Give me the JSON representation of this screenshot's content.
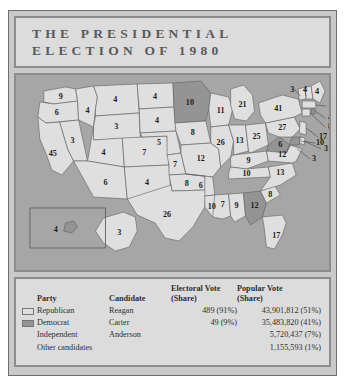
{
  "title": {
    "line1": "THE PRESIDENTIAL",
    "line2": "ELECTION OF 1980"
  },
  "colors": {
    "page_background": "#ffffff",
    "figure_background": "#c9c9c9",
    "frame_border": "#6e6e6e",
    "panel_border": "#8c8c8c",
    "title_background": "#dcdcdc",
    "title_text": "#5a5a5a",
    "ocean": "#a6a6a6",
    "republican_fill": "#dfdfdf",
    "democrat_fill": "#949494",
    "state_outline": "#5f5f5f",
    "table_background": "#dcdcdc",
    "table_text": "#2f2f2f"
  },
  "legend_table": {
    "headers": {
      "party": "Party",
      "candidate": "Candidate",
      "electoral_line1": "Electoral Vote",
      "electoral_line2": "(Share)",
      "popular_line1": "Popular Vote",
      "popular_line2": "(Share)"
    },
    "rows": [
      {
        "swatch": "republican-swatch",
        "party": "Republican",
        "candidate": "Reagan",
        "electoral": "489 (91%)",
        "popular": "43,901,812 (51%)"
      },
      {
        "swatch": "democrat-swatch",
        "party": "Democrat",
        "candidate": "Carter",
        "electoral": "49 (9%)",
        "popular": "35,483,820 (41%)"
      },
      {
        "swatch": "none",
        "party": "Independent",
        "candidate": "Anderson",
        "electoral": "",
        "popular": "5,720,437 (7%)"
      },
      {
        "swatch": "none",
        "party": "Other candidates",
        "candidate": "",
        "electoral": "",
        "popular": "1,155,593 (1%)"
      }
    ]
  },
  "map": {
    "type": "choropleth-electoral-map",
    "region": "United States",
    "year": 1980,
    "states": [
      {
        "code": "WA",
        "electoral_votes": 9,
        "winner": "Republican"
      },
      {
        "code": "OR",
        "electoral_votes": 6,
        "winner": "Republican"
      },
      {
        "code": "CA",
        "electoral_votes": 45,
        "winner": "Republican"
      },
      {
        "code": "NV",
        "electoral_votes": 3,
        "winner": "Republican"
      },
      {
        "code": "ID",
        "electoral_votes": 4,
        "winner": "Republican"
      },
      {
        "code": "MT",
        "electoral_votes": 4,
        "winner": "Republican"
      },
      {
        "code": "WY",
        "electoral_votes": 3,
        "winner": "Republican"
      },
      {
        "code": "UT",
        "electoral_votes": 4,
        "winner": "Republican"
      },
      {
        "code": "CO",
        "electoral_votes": 7,
        "winner": "Republican"
      },
      {
        "code": "AZ",
        "electoral_votes": 6,
        "winner": "Republican"
      },
      {
        "code": "NM",
        "electoral_votes": 4,
        "winner": "Republican"
      },
      {
        "code": "ND",
        "electoral_votes": 4,
        "winner": "Republican"
      },
      {
        "code": "SD",
        "electoral_votes": 4,
        "winner": "Republican"
      },
      {
        "code": "NE",
        "electoral_votes": 5,
        "winner": "Republican"
      },
      {
        "code": "KS",
        "electoral_votes": 7,
        "winner": "Republican"
      },
      {
        "code": "OK",
        "electoral_votes": 8,
        "winner": "Republican"
      },
      {
        "code": "TX",
        "electoral_votes": 26,
        "winner": "Republican"
      },
      {
        "code": "MN",
        "electoral_votes": 10,
        "winner": "Democrat"
      },
      {
        "code": "IA",
        "electoral_votes": 8,
        "winner": "Republican"
      },
      {
        "code": "MO",
        "electoral_votes": 12,
        "winner": "Republican"
      },
      {
        "code": "AR",
        "electoral_votes": 6,
        "winner": "Republican"
      },
      {
        "code": "LA",
        "electoral_votes": 10,
        "winner": "Republican"
      },
      {
        "code": "MS",
        "electoral_votes": 7,
        "winner": "Republican"
      },
      {
        "code": "AL",
        "electoral_votes": 9,
        "winner": "Republican"
      },
      {
        "code": "GA",
        "electoral_votes": 12,
        "winner": "Democrat"
      },
      {
        "code": "FL",
        "electoral_votes": 17,
        "winner": "Republican"
      },
      {
        "code": "TN",
        "electoral_votes": 10,
        "winner": "Republican"
      },
      {
        "code": "KY",
        "electoral_votes": 9,
        "winner": "Republican"
      },
      {
        "code": "SC",
        "electoral_votes": 8,
        "winner": "Republican"
      },
      {
        "code": "NC",
        "electoral_votes": 13,
        "winner": "Republican"
      },
      {
        "code": "VA",
        "electoral_votes": 12,
        "winner": "Republican"
      },
      {
        "code": "WV",
        "electoral_votes": 6,
        "winner": "Democrat"
      },
      {
        "code": "WI",
        "electoral_votes": 11,
        "winner": "Republican"
      },
      {
        "code": "IL",
        "electoral_votes": 26,
        "winner": "Republican"
      },
      {
        "code": "IN",
        "electoral_votes": 13,
        "winner": "Republican"
      },
      {
        "code": "MI",
        "electoral_votes": 21,
        "winner": "Republican"
      },
      {
        "code": "OH",
        "electoral_votes": 25,
        "winner": "Republican"
      },
      {
        "code": "PA",
        "electoral_votes": 27,
        "winner": "Republican"
      },
      {
        "code": "NY",
        "electoral_votes": 41,
        "winner": "Republican"
      },
      {
        "code": "ME",
        "electoral_votes": 4,
        "winner": "Republican"
      },
      {
        "code": "NH",
        "electoral_votes": 4,
        "winner": "Republican"
      },
      {
        "code": "VT",
        "electoral_votes": 3,
        "winner": "Republican"
      },
      {
        "code": "MA",
        "electoral_votes": 14,
        "winner": "Republican"
      },
      {
        "code": "RI",
        "electoral_votes": 4,
        "winner": "Democrat"
      },
      {
        "code": "CT",
        "electoral_votes": 8,
        "winner": "Republican"
      },
      {
        "code": "NJ",
        "electoral_votes": 17,
        "winner": "Republican"
      },
      {
        "code": "DE",
        "electoral_votes": 3,
        "winner": "Republican"
      },
      {
        "code": "MD",
        "electoral_votes": 10,
        "winner": "Democrat"
      },
      {
        "code": "DC",
        "electoral_votes": 3,
        "winner": "Democrat"
      },
      {
        "code": "AK",
        "electoral_votes": 3,
        "winner": "Republican"
      },
      {
        "code": "HI",
        "electoral_votes": 4,
        "winner": "Democrat"
      }
    ]
  }
}
